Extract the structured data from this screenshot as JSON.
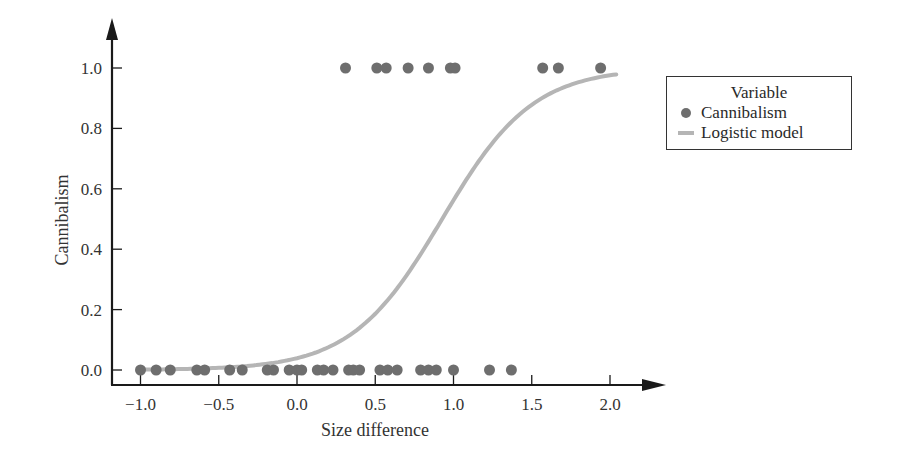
{
  "chart_data": {
    "type": "scatter",
    "title": "",
    "xlabel": "Size difference",
    "ylabel": "Cannibalism",
    "xlim": [
      -1.1,
      2.3
    ],
    "ylim": [
      0.0,
      1.1
    ],
    "x_ticks": [
      "−1.0",
      "−0.5",
      "0.0",
      "0.5",
      "1.0",
      "1.5",
      "2.0"
    ],
    "x_tick_values": [
      -1.0,
      -0.5,
      0.0,
      0.5,
      1.0,
      1.5,
      2.0
    ],
    "y_ticks": [
      "0.0",
      "0.2",
      "0.4",
      "0.6",
      "0.8",
      "1.0"
    ],
    "y_tick_values": [
      0.0,
      0.2,
      0.4,
      0.6,
      0.8,
      1.0
    ],
    "grid": false,
    "legend": {
      "title": "Variable",
      "position": "right",
      "entries": [
        "Cannibalism",
        "Logistic model"
      ]
    },
    "series": [
      {
        "name": "Cannibalism",
        "type": "scatter",
        "color": "#6e6e6e",
        "points": [
          [
            -1.0,
            0
          ],
          [
            -0.9,
            0
          ],
          [
            -0.81,
            0
          ],
          [
            -0.64,
            0
          ],
          [
            -0.59,
            0
          ],
          [
            -0.43,
            0
          ],
          [
            -0.35,
            0
          ],
          [
            -0.19,
            0
          ],
          [
            -0.15,
            0
          ],
          [
            -0.05,
            0
          ],
          [
            0.0,
            0
          ],
          [
            0.03,
            0
          ],
          [
            0.13,
            0
          ],
          [
            0.17,
            0
          ],
          [
            0.23,
            0
          ],
          [
            0.33,
            0
          ],
          [
            0.36,
            0
          ],
          [
            0.4,
            0
          ],
          [
            0.53,
            0
          ],
          [
            0.58,
            0
          ],
          [
            0.64,
            0
          ],
          [
            0.79,
            0
          ],
          [
            0.84,
            0
          ],
          [
            0.89,
            0
          ],
          [
            1.0,
            0
          ],
          [
            1.23,
            0
          ],
          [
            1.37,
            0
          ],
          [
            0.31,
            1
          ],
          [
            0.51,
            1
          ],
          [
            0.57,
            1
          ],
          [
            0.71,
            1
          ],
          [
            0.84,
            1
          ],
          [
            0.98,
            1
          ],
          [
            1.01,
            1
          ],
          [
            1.57,
            1
          ],
          [
            1.67,
            1
          ],
          [
            1.94,
            1
          ]
        ]
      },
      {
        "name": "Logistic model",
        "type": "line",
        "color": "#b5b5b5",
        "model": {
          "intercept": -3.2,
          "slope": 3.45
        },
        "x": [
          -1.0,
          -0.5,
          0.0,
          0.25,
          0.5,
          0.75,
          1.0,
          1.25,
          1.5,
          1.75,
          2.05
        ],
        "values": [
          0.001,
          0.007,
          0.04,
          0.09,
          0.18,
          0.36,
          0.56,
          0.75,
          0.87,
          0.94,
          0.97
        ]
      }
    ]
  }
}
